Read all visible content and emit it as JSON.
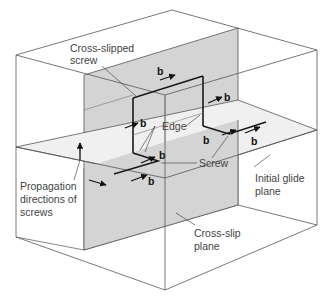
{
  "figure": {
    "labels": {
      "cross_slipped_screw_line1": "Cross-slipped",
      "cross_slipped_screw_line2": "screw",
      "edge": "Edge",
      "screw": "Screw",
      "propagation_line1": "Propagation",
      "propagation_line2": "directions of",
      "propagation_line3": "screws",
      "initial_glide_line1": "Initial glide",
      "initial_glide_line2": "plane",
      "cross_slip_line1": "Cross-slip",
      "cross_slip_line2": "plane"
    },
    "burgers_vector_symbol": "b",
    "burgers_vectors": [
      {
        "id": "top",
        "label": "b"
      },
      {
        "id": "right-vertical",
        "label": "b"
      },
      {
        "id": "left-vertical",
        "label": "b"
      },
      {
        "id": "glide-left-upper",
        "label": "b"
      },
      {
        "id": "glide-left-lower",
        "label": "b"
      },
      {
        "id": "glide-right-upper",
        "label": "b"
      },
      {
        "id": "glide-right-lower",
        "label": "b"
      }
    ],
    "colors": {
      "cross_slip_plane": "#d4d4d4",
      "glide_plane": "#efefef",
      "outline": "#555555",
      "dislocation": "#1a1a1a"
    }
  }
}
